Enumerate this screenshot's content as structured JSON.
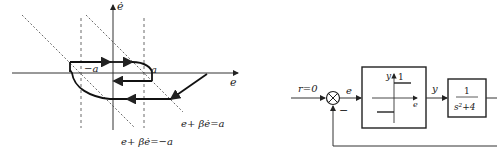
{
  "phase_plane": {
    "x_axis_label": "e",
    "y_axis_label": "ė",
    "left_switch_label": "−a",
    "right_switch_label": "a",
    "line_upper_label": "e+ βė=a",
    "line_lower_label": "e+ βė=−a"
  },
  "block_diagram": {
    "input_label": "r=0",
    "error_label": "e",
    "feedback_sign": "−",
    "relay_y_label": "y",
    "relay_level_label": "1",
    "relay_e_label": "e",
    "output_label": "y",
    "plant_numerator": "1",
    "plant_denominator": "s²+4"
  }
}
